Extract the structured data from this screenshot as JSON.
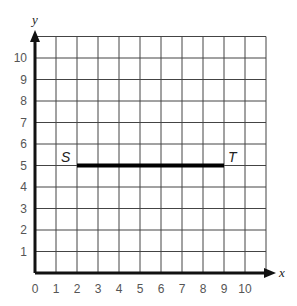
{
  "chart_data": {
    "type": "line",
    "title": "",
    "xlabel": "x",
    "ylabel": "y",
    "xlim": [
      0,
      11
    ],
    "ylim": [
      0,
      11
    ],
    "grid": true,
    "x_ticks": [
      "0",
      "1",
      "2",
      "3",
      "4",
      "5",
      "6",
      "7",
      "8",
      "9",
      "10"
    ],
    "y_ticks": [
      "1",
      "2",
      "3",
      "4",
      "5",
      "6",
      "7",
      "8",
      "9",
      "10"
    ],
    "series": [
      {
        "name": "ST",
        "points": [
          {
            "label": "S",
            "x": 2,
            "y": 5
          },
          {
            "label": "T",
            "x": 9,
            "y": 5
          }
        ]
      }
    ]
  },
  "labels": {
    "x_axis": "x",
    "y_axis": "y",
    "point_s": "S",
    "point_t": "T"
  }
}
